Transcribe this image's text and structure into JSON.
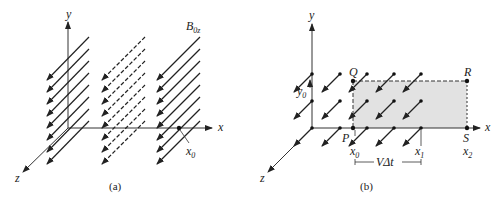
{
  "figure": {
    "panels": [
      {
        "id": "a",
        "caption": "(a)",
        "axes": {
          "x": "x",
          "y": "y",
          "z": "z"
        },
        "field_label": {
          "main": "B",
          "sub": "0z"
        },
        "point_label": {
          "main": "x",
          "sub": "0"
        },
        "groups": [
          {
            "style": "solid"
          },
          {
            "style": "dashed"
          },
          {
            "style": "solid"
          }
        ]
      },
      {
        "id": "b",
        "caption": "(b)",
        "axes": {
          "x": "x",
          "y": "y",
          "z": "z"
        },
        "points": {
          "P": "P",
          "Q": "Q",
          "R": "R",
          "S": "S"
        },
        "x_labels": [
          {
            "main": "x",
            "sub": "0"
          },
          {
            "main": "x",
            "sub": "1"
          },
          {
            "main": "x",
            "sub": "2"
          }
        ],
        "y_label": {
          "main": "y",
          "sub": "0"
        },
        "interval_label": "VΔt",
        "shaded_color": "#e0e0e0"
      }
    ]
  }
}
